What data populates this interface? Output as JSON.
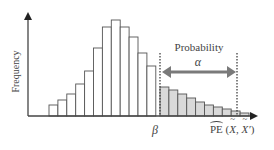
{
  "figure": {
    "type": "histogram-diagram",
    "y_axis_label": "Frequency",
    "annotation_label": "Probability",
    "annotation_symbol": "α",
    "threshold_label": "β",
    "x_axis_label": {
      "operator": "PE",
      "open": " (",
      "arg1": "X",
      "sep": ", ",
      "arg2": "X′",
      "close": ")"
    },
    "colors": {
      "bar_fill": "#ffffff",
      "bar_stroke": "#555555",
      "shaded_fill": "#d9d9d9",
      "axis": "#444444",
      "arrow": "#7a7a7a",
      "dashed_line": "#333333"
    }
  },
  "chart_data": {
    "type": "bar",
    "title": "",
    "xlabel": "PE(X̃, X̃′)",
    "ylabel": "Frequency",
    "bins_unshaded": [
      11,
      16,
      22,
      32,
      45,
      68,
      89,
      96,
      89,
      79,
      63,
      50
    ],
    "bins_shaded": [
      29,
      26,
      22,
      18,
      14,
      11,
      9,
      7,
      5,
      3
    ],
    "threshold": "β",
    "tail_probability": "α",
    "grid": false
  }
}
